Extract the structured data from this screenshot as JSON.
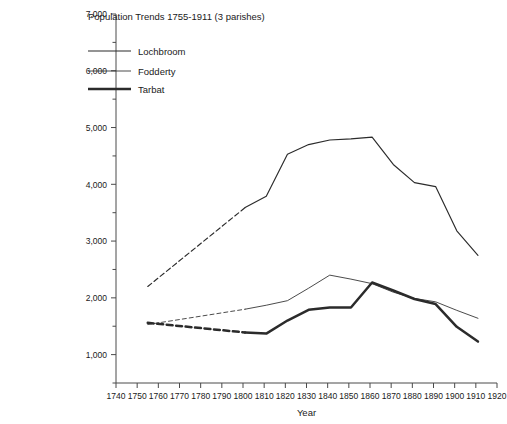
{
  "chart_data": {
    "type": "line",
    "title": "Population Trends 1755-1911 (3 parishes)",
    "xlabel": "Year",
    "ylabel": "",
    "xlim": [
      1740,
      1920
    ],
    "ylim": [
      500,
      7000
    ],
    "x_ticks": [
      1740,
      1750,
      1760,
      1770,
      1780,
      1790,
      1800,
      1810,
      1820,
      1830,
      1840,
      1850,
      1860,
      1870,
      1880,
      1890,
      1900,
      1910,
      1920
    ],
    "y_ticks": [
      1000,
      2000,
      3000,
      4000,
      5000,
      6000,
      7000
    ],
    "y_minor_ticks": [
      500,
      1500,
      2500,
      3500,
      4500,
      5500,
      6500
    ],
    "grid": false,
    "legend_position": "top-left",
    "series": [
      {
        "name": "Lochbroom",
        "x": [
          1755,
          1801,
          1811,
          1821,
          1831,
          1841,
          1851,
          1861,
          1871,
          1881,
          1891,
          1901,
          1911
        ],
        "values": [
          2200,
          3590,
          3790,
          4530,
          4700,
          4780,
          4800,
          4830,
          4350,
          4030,
          3960,
          3180,
          2750
        ],
        "dashed_until": 1801
      },
      {
        "name": "Fodderty",
        "x": [
          1755,
          1801,
          1811,
          1821,
          1831,
          1841,
          1851,
          1861,
          1871,
          1881,
          1891,
          1901,
          1911
        ],
        "values": [
          1530,
          1800,
          1870,
          1950,
          2170,
          2400,
          2330,
          2250,
          2100,
          1990,
          1930,
          1780,
          1640
        ],
        "dashed_until": 1801
      },
      {
        "name": "Tarbat",
        "x": [
          1755,
          1801,
          1811,
          1821,
          1831,
          1841,
          1851,
          1861,
          1871,
          1881,
          1891,
          1901,
          1911
        ],
        "values": [
          1560,
          1390,
          1370,
          1600,
          1790,
          1830,
          1830,
          2270,
          2130,
          1980,
          1890,
          1490,
          1230
        ],
        "dashed_until": 1801
      }
    ]
  },
  "legend": {
    "items": [
      {
        "label": "Lochbroom"
      },
      {
        "label": "Fodderty"
      },
      {
        "label": "Tarbat"
      }
    ]
  },
  "axis": {
    "x_title": "Year",
    "y_tick_labels": [
      "1,000",
      "2,000",
      "3,000",
      "4,000",
      "5,000",
      "6,000",
      "7,000"
    ],
    "x_tick_labels": [
      "1740",
      "1750",
      "1760",
      "1770",
      "1780",
      "1790",
      "1800",
      "1810",
      "1820",
      "1830",
      "1840",
      "1850",
      "1860",
      "1870",
      "1880",
      "1890",
      "1900",
      "1910",
      "1920"
    ]
  },
  "style": {
    "axis_color": "#4a4a4a",
    "line_color": "#2b2b2b",
    "background": "#ffffff"
  }
}
